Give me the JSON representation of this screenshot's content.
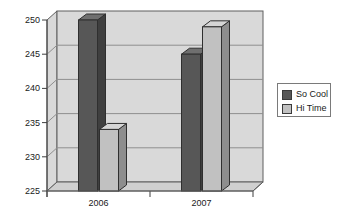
{
  "figure": {
    "width": 337,
    "height": 217,
    "background": "#ffffff"
  },
  "chart_data": {
    "type": "bar",
    "subtype": "3d-column",
    "title": "",
    "xlabel": "",
    "ylabel": "",
    "categories": [
      "2006",
      "2007"
    ],
    "series": [
      {
        "name": "So Cool",
        "values": [
          250,
          245
        ],
        "color": "#575757",
        "color_side": "#3f3f3f",
        "color_top": "#6f6f6f"
      },
      {
        "name": "Hi Time",
        "values": [
          234,
          249
        ],
        "color": "#c1c1c1",
        "color_side": "#8d8d8d",
        "color_top": "#d5d5d5"
      }
    ],
    "ylim": [
      225,
      250
    ],
    "ytick_step": 5,
    "yticks": [
      "225",
      "230",
      "235",
      "240",
      "245",
      "250"
    ],
    "grid": true,
    "legend_position": "right",
    "colors": {
      "wall": "#d9d9d9",
      "floor": "#cfcfcf",
      "gridline": "#8f8f8f",
      "outline": "#5f5f5f",
      "bar_outline": "#2f2f2f",
      "axis": "#3f3f3f",
      "text": "#1a1a1a",
      "legend_border": "#7a7a7a",
      "legend_bg": "#ffffff"
    }
  }
}
